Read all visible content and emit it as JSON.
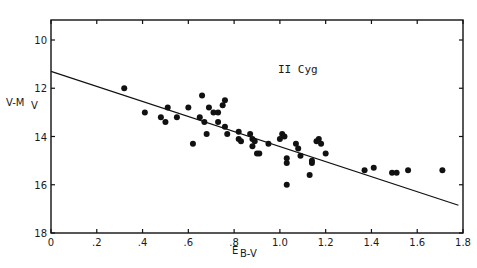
{
  "chart_data": {
    "type": "scatter",
    "title": "",
    "annotation": "II Cyg",
    "xlabel": "E_{B-V}",
    "xlabel_main": "E",
    "xlabel_sub": "B-V",
    "ylabel": "V-M_V",
    "ylabel_main": "V-M",
    "ylabel_sub": "V",
    "xlim": [
      0,
      1.8
    ],
    "ylim": [
      18,
      10
    ],
    "y_inverted": true,
    "grid": false,
    "legend": "none",
    "x_ticks": [
      0,
      0.2,
      0.4,
      0.6,
      0.8,
      1.0,
      1.2,
      1.4,
      1.6,
      1.8
    ],
    "x_tick_labels": [
      "0",
      ".2",
      ".4",
      ".6",
      ".8",
      "1.0",
      "1.2",
      "1.4",
      "1.6",
      "1.8"
    ],
    "y_ticks": [
      10,
      12,
      14,
      16,
      18
    ],
    "y_tick_labels": [
      "10",
      "12",
      "14",
      "16",
      "18"
    ],
    "fit_line": {
      "x": [
        0,
        1.78
      ],
      "y": [
        11.3,
        16.85
      ]
    },
    "series": [
      {
        "name": "II Cyg stars",
        "marker": "filled-circle",
        "points": [
          [
            0.32,
            12.0
          ],
          [
            0.41,
            13.0
          ],
          [
            0.48,
            13.2
          ],
          [
            0.5,
            13.4
          ],
          [
            0.51,
            12.8
          ],
          [
            0.55,
            13.2
          ],
          [
            0.6,
            12.8
          ],
          [
            0.62,
            14.3
          ],
          [
            0.66,
            12.3
          ],
          [
            0.65,
            13.2
          ],
          [
            0.67,
            13.4
          ],
          [
            0.68,
            13.9
          ],
          [
            0.69,
            12.8
          ],
          [
            0.71,
            13.0
          ],
          [
            0.73,
            13.0
          ],
          [
            0.73,
            13.4
          ],
          [
            0.75,
            12.7
          ],
          [
            0.76,
            12.5
          ],
          [
            0.76,
            13.6
          ],
          [
            0.77,
            13.9
          ],
          [
            0.82,
            13.8
          ],
          [
            0.82,
            14.1
          ],
          [
            0.83,
            14.2
          ],
          [
            0.87,
            13.9
          ],
          [
            0.88,
            14.1
          ],
          [
            0.88,
            14.4
          ],
          [
            0.89,
            14.2
          ],
          [
            0.9,
            14.7
          ],
          [
            0.91,
            14.7
          ],
          [
            0.95,
            14.3
          ],
          [
            1.0,
            14.1
          ],
          [
            1.01,
            13.9
          ],
          [
            1.02,
            14.0
          ],
          [
            1.03,
            15.1
          ],
          [
            1.03,
            14.9
          ],
          [
            1.03,
            16.0
          ],
          [
            1.07,
            14.3
          ],
          [
            1.08,
            14.5
          ],
          [
            1.09,
            14.8
          ],
          [
            1.13,
            15.6
          ],
          [
            1.14,
            15.0
          ],
          [
            1.14,
            15.1
          ],
          [
            1.16,
            14.2
          ],
          [
            1.17,
            14.1
          ],
          [
            1.18,
            14.3
          ],
          [
            1.2,
            14.7
          ],
          [
            1.37,
            15.4
          ],
          [
            1.41,
            15.3
          ],
          [
            1.49,
            15.5
          ],
          [
            1.51,
            15.5
          ],
          [
            1.56,
            15.4
          ],
          [
            1.71,
            15.4
          ]
        ]
      }
    ]
  },
  "colors": {
    "ink": "#111111",
    "background": "#ffffff"
  }
}
